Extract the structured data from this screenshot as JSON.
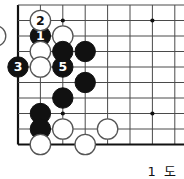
{
  "figure": {
    "kind": "go-diagram",
    "caption": "1 도",
    "board": {
      "cols": 8,
      "rows": 9,
      "origin_x": 18,
      "origin_y": 5,
      "step_x": 22.4,
      "step_y": 15.5,
      "edges": {
        "left": true,
        "bottom": true,
        "top": false,
        "right": false
      },
      "line_color": "#4a4a4a",
      "edge_color": "#111111",
      "background": "#ffffff",
      "stone_radius": 10.2,
      "star_points": [
        {
          "col": 2,
          "row": 1
        },
        {
          "col": 6,
          "row": 1
        },
        {
          "col": 2,
          "row": 7
        },
        {
          "col": 6,
          "row": 7
        }
      ]
    },
    "colors": {
      "black_stone": "#111111",
      "white_stone": "#ffffff",
      "white_stone_edge": "#555555",
      "black_label": "#ffffff",
      "white_label": "#111111"
    },
    "stones": [
      {
        "color": "black",
        "col": 1,
        "row": 2,
        "label": "1"
      },
      {
        "color": "white",
        "col": 1,
        "row": 1,
        "label": "2"
      },
      {
        "color": "black",
        "col": 0,
        "row": 4,
        "label": "3"
      },
      {
        "color": "white",
        "col": -1,
        "row": 2,
        "label": "4"
      },
      {
        "color": "black",
        "col": 2,
        "row": 4,
        "label": "5"
      },
      {
        "color": "white",
        "col": 2,
        "row": 2,
        "label": ""
      },
      {
        "color": "white",
        "col": 1,
        "row": 3,
        "label": ""
      },
      {
        "color": "black",
        "col": 2,
        "row": 3,
        "label": ""
      },
      {
        "color": "black",
        "col": 3,
        "row": 3,
        "label": ""
      },
      {
        "color": "white",
        "col": 1,
        "row": 4,
        "label": ""
      },
      {
        "color": "black",
        "col": 3,
        "row": 5,
        "label": ""
      },
      {
        "color": "black",
        "col": 2,
        "row": 6,
        "label": ""
      },
      {
        "color": "black",
        "col": 1,
        "row": 7,
        "label": ""
      },
      {
        "color": "black",
        "col": 1,
        "row": 8,
        "label": ""
      },
      {
        "color": "white",
        "col": 2,
        "row": 8,
        "label": ""
      },
      {
        "color": "white",
        "col": 4,
        "row": 8,
        "label": ""
      },
      {
        "color": "white",
        "col": 1,
        "row": 9,
        "label": ""
      },
      {
        "color": "white",
        "col": 3,
        "row": 9,
        "label": ""
      }
    ]
  }
}
